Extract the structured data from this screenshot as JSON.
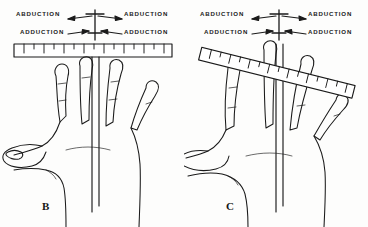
{
  "figure": {
    "background_color": "#fdfdfc",
    "ink_color": "#1a1a1a",
    "width": 368,
    "height": 227
  },
  "panels": [
    {
      "letter": "B",
      "description": "Fingers abducted with goniometer ruler held horizontally across the fingertips",
      "ruler": {
        "orientation": "horizontal",
        "rotation_deg": 0,
        "major_ticks": 7,
        "minor_ticks": 7
      },
      "labels": {
        "abduction_left": "ABDUCTION",
        "abduction_right": "ABDUCTION",
        "adduction_left": "ADDUCTION",
        "adduction_right": "ADDUCTION"
      }
    },
    {
      "letter": "C",
      "description": "Fingers adducted with goniometer ruler tilted obliquely across the fingertips",
      "ruler": {
        "orientation": "tilted",
        "rotation_deg": 14,
        "major_ticks": 7,
        "minor_ticks": 7
      },
      "labels": {
        "abduction_left": "ABDUCTION",
        "abduction_right": "ABDUCTION",
        "adduction_left": "ADDUCTION",
        "adduction_right": "ADDUCTION"
      }
    }
  ]
}
